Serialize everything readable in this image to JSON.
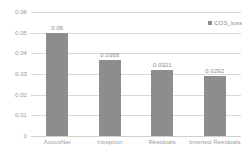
{
  "chart_data": {
    "type": "bar",
    "title": "",
    "xlabel": "",
    "ylabel": "",
    "categories": [
      "AcousNet",
      "Inception",
      "Residuals",
      "Inverted Residuals"
    ],
    "values": [
      0.05,
      0.0368,
      0.0321,
      0.0292
    ],
    "value_labels": [
      "0.05",
      "0.0368",
      "0.0321",
      "0.0292"
    ],
    "series": [
      {
        "name": "COS_loss",
        "values": [
          0.05,
          0.0368,
          0.0321,
          0.0292
        ],
        "color": "#8d8d8d"
      }
    ],
    "ylim": [
      0,
      0.06
    ],
    "yticks": [
      0,
      0.01,
      0.02,
      0.03,
      0.04,
      0.05,
      0.06
    ],
    "ytick_labels": [
      "0",
      "0.01",
      "0.02",
      "0.03",
      "0.04",
      "0.05",
      "0.06"
    ],
    "grid": true,
    "grid_color": "#d9d9d9",
    "legend": {
      "position": "top-right",
      "entries": [
        {
          "label": "COS_loss",
          "color": "#8d8d8d",
          "marker": "square-marker-icon"
        }
      ]
    },
    "background": "#ffffff",
    "axis_label_color": "#9a9a9a"
  }
}
